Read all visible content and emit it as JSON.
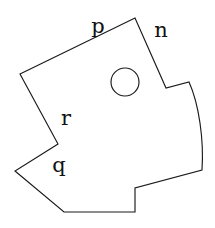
{
  "figure": {
    "canvas": {
      "width": 215,
      "height": 228,
      "background": "#ffffff"
    },
    "stroke_color": "#1a1a1a",
    "label_color": "#111111",
    "outline": {
      "name": "irregular-polygon-with-notches",
      "path": "M 20 74 L 135 18 L 166 88 L 189 82 C 199 104 204 140 202 170 L 135 188 L 135 212 L 64 212 L 15 171 L 58 144 Z",
      "vertices": [
        [
          20,
          74
        ],
        [
          135,
          18
        ],
        [
          166,
          88
        ],
        [
          189,
          82
        ],
        [
          202,
          170
        ],
        [
          135,
          188
        ],
        [
          135,
          212
        ],
        [
          64,
          212
        ],
        [
          15,
          171
        ],
        [
          58,
          144
        ]
      ]
    },
    "hole": {
      "name": "circle",
      "cx": 125,
      "cy": 82,
      "r": 14
    },
    "labels": [
      {
        "id": "p",
        "text": "p",
        "x": 98,
        "y": 26
      },
      {
        "id": "n",
        "text": "n",
        "x": 161,
        "y": 30
      },
      {
        "id": "r",
        "text": "r",
        "x": 66,
        "y": 118
      },
      {
        "id": "q",
        "text": "q",
        "x": 59,
        "y": 165
      }
    ]
  }
}
